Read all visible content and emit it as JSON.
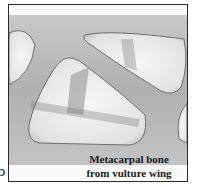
{
  "figure": {
    "panel_label": "b",
    "caption_line1": "Metacarpal bone",
    "caption_line2": "from vulture wing",
    "colors": {
      "frame": "#2a2a2a",
      "bone_light": "#d8d8d8",
      "bone_dark": "#8a8a8a",
      "cavity": "#f2f2f2",
      "caption_text": "#1a1a1a"
    }
  }
}
